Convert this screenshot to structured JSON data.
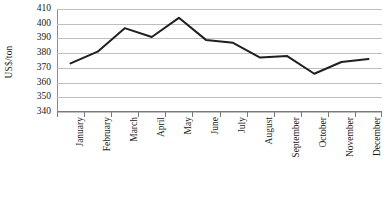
{
  "chart_data": {
    "type": "line",
    "title": "",
    "xlabel": "",
    "ylabel": "US$/ton",
    "categories": [
      "January",
      "February",
      "March",
      "April",
      "May",
      "June",
      "July",
      "August",
      "September",
      "October",
      "November",
      "December"
    ],
    "values": [
      373,
      381,
      397,
      391,
      404,
      389,
      387,
      377,
      378,
      366,
      374,
      376
    ],
    "series": [
      {
        "name": "US$/ton",
        "values": [
          373,
          381,
          397,
          391,
          404,
          389,
          387,
          377,
          378,
          366,
          374,
          376
        ]
      }
    ],
    "ylim": [
      340,
      410
    ],
    "ytick_step": 10,
    "yticks": [
      410,
      400,
      390,
      380,
      370,
      360,
      350,
      340
    ],
    "ytick_labels": [
      "410",
      "400",
      "390",
      "380",
      "370",
      "360",
      "350",
      "340"
    ],
    "grid": true,
    "grid_axis": "y",
    "legend": false,
    "legend_position": "none",
    "line_color": "#1f1f1f",
    "grid_color": "#bfbfbf",
    "axis_color": "#7a7a7a",
    "background_color": "#ffffff",
    "markers": false,
    "line_width": 2
  }
}
